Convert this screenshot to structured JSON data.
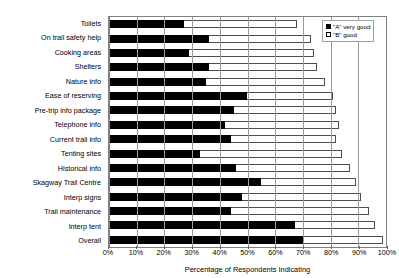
{
  "chart_data": {
    "type": "bar",
    "orientation": "horizontal",
    "stacked": true,
    "title": "",
    "xlabel": "Percentage of Respondents Indicating",
    "ylabel": "",
    "xlim": [
      0,
      100
    ],
    "grid": true,
    "legend_position": "top-right",
    "tick_labels": [
      "0%",
      "10%",
      "20%",
      "30%",
      "40%",
      "50%",
      "60%",
      "70%",
      "80%",
      "90%",
      "100%"
    ],
    "tick_values": [
      0,
      10,
      20,
      30,
      40,
      50,
      60,
      70,
      80,
      90,
      100
    ],
    "categories": [
      "Toilets",
      "On trail safety help",
      "Cooking areas",
      "Shelters",
      "Nature info",
      "Ease of reserving",
      "Pre-trip info package",
      "Telephone info",
      "Current trail info",
      "Tenting sites",
      "Historical info",
      "Skagway Trail Centre",
      "Interp signs",
      "Trail maintenance",
      "Interp tent",
      "Overall"
    ],
    "series": [
      {
        "name": "\"A\" very good",
        "color": "#000000",
        "values": [
          27,
          36,
          29,
          36,
          35,
          50,
          45,
          42,
          44,
          33,
          46,
          55,
          48,
          44,
          67,
          70
        ]
      },
      {
        "name": "\"B\" good",
        "color": "#ffffff",
        "values": [
          41,
          37,
          45,
          39,
          43,
          31,
          37,
          41,
          38,
          51,
          41,
          34,
          43,
          50,
          29,
          29
        ]
      }
    ],
    "totals": [
      68,
      73,
      74,
      75,
      78,
      81,
      82,
      83,
      82,
      84,
      87,
      89,
      91,
      94,
      96,
      99
    ]
  },
  "legend": {
    "items": [
      {
        "label": "\"A\" very good",
        "swatch": "black-square-icon"
      },
      {
        "label": "\"B\" good",
        "swatch": "white-square-icon"
      }
    ]
  }
}
